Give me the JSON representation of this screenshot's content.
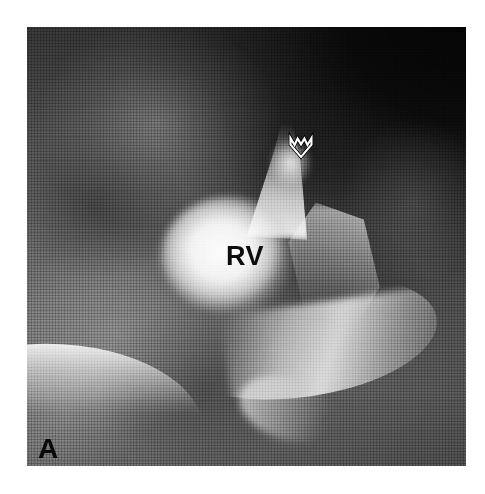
{
  "figure": {
    "panel_label": "A",
    "modality": "radiograph",
    "view": "angiographic film",
    "annotations": {
      "chamber_label": "RV",
      "arrow": {
        "icon": "open-down-arrow-icon",
        "direction": "down",
        "style": "outlined-white",
        "points_to": "RV"
      }
    }
  },
  "colors": {
    "page_background": "#ffffff",
    "film_dark": "#0d0d0d",
    "film_mid": "#787878",
    "contrast_bright": "#fcfcfc",
    "label_text": "#0d0d0d",
    "arrow_stroke": "#ffffff",
    "arrow_outline": "#000000"
  }
}
